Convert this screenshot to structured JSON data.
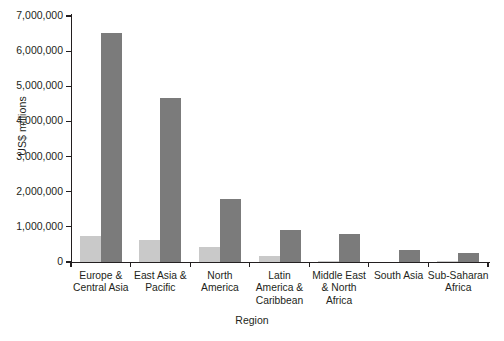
{
  "chart_data": {
    "type": "bar",
    "title": "",
    "xlabel": "Region",
    "ylabel": "US$ millions",
    "ylim": [
      0,
      7000000
    ],
    "ytick_labels": [
      "7,000,000",
      "6,000,000",
      "5,000,000",
      "4,000,000",
      "3,000,000",
      "2,000,000",
      "1,000,000",
      "0"
    ],
    "ytick_values": [
      7000000,
      6000000,
      5000000,
      4000000,
      3000000,
      2000000,
      1000000,
      0
    ],
    "grid": false,
    "legend": "none",
    "categories": [
      "Europe & Central Asia",
      "East Asia & Pacific",
      "North America",
      "Latin America & Caribbean",
      "Middle East & North Africa",
      "South Asia",
      "Sub-Saharan Africa"
    ],
    "category_lines": [
      [
        "Europe &",
        "Central Asia"
      ],
      [
        "East Asia &",
        "Pacific"
      ],
      [
        "North",
        "America"
      ],
      [
        "Latin",
        "America &",
        "Caribbean"
      ],
      [
        "Middle East",
        "& North",
        "Africa"
      ],
      [
        "South Asia"
      ],
      [
        "Sub-Saharan",
        "Africa"
      ]
    ],
    "series": [
      {
        "name": "series-light",
        "color": "#c9c9c9",
        "values": [
          750000,
          620000,
          430000,
          170000,
          40000,
          0,
          30000
        ]
      },
      {
        "name": "series-dark",
        "color": "#7b7b7b",
        "values": [
          6520000,
          4670000,
          1800000,
          910000,
          800000,
          330000,
          270000
        ]
      }
    ]
  },
  "colors": {
    "axis": "#231f20",
    "series_light": "#c9c9c9",
    "series_dark": "#7b7b7b",
    "background": "#ffffff"
  }
}
